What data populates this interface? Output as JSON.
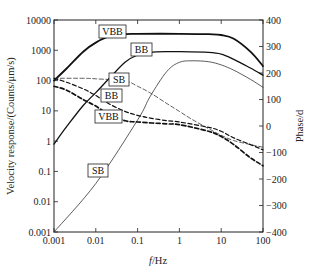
{
  "chart_data": {
    "type": "line",
    "title": "",
    "xlabel": "f/Hz",
    "ylabel": "Velocity response/(Counts/μm/s)",
    "y2label": "Phase/d",
    "xscale": "log",
    "yscale": "log",
    "xlim": [
      0.001,
      100
    ],
    "ylim": [
      0.001,
      10000
    ],
    "y2lim": [
      -400,
      400
    ],
    "grid": false,
    "legend": "inline boxed labels",
    "x_ticks": [
      "0.001",
      "0.01",
      "0.1",
      "1",
      "10",
      "100"
    ],
    "y_ticks": [
      "0.001",
      "0.01",
      "0.1",
      "1",
      "10",
      "100",
      "1000",
      "10000"
    ],
    "y2_ticks": [
      "-400",
      "-300",
      "-200",
      "-100",
      "0",
      "100",
      "200",
      "300",
      "400"
    ],
    "series": [
      {
        "name": "VBB",
        "kind": "amplitude",
        "axis": "left",
        "style": "solid-thick",
        "x": [
          0.001,
          0.002,
          0.005,
          0.01,
          0.02,
          0.05,
          0.1,
          1,
          5,
          10,
          20,
          50,
          100
        ],
        "y": [
          100,
          250,
          900,
          1800,
          2800,
          3400,
          3500,
          3500,
          3400,
          3200,
          2400,
          900,
          300
        ]
      },
      {
        "name": "BB",
        "kind": "amplitude",
        "axis": "left",
        "style": "solid",
        "x": [
          0.001,
          0.002,
          0.005,
          0.01,
          0.02,
          0.05,
          0.1,
          0.2,
          0.5,
          1,
          5,
          10,
          20,
          50,
          100
        ],
        "y": [
          0.8,
          3,
          15,
          40,
          110,
          400,
          700,
          850,
          900,
          900,
          850,
          750,
          500,
          260,
          150
        ]
      },
      {
        "name": "SB",
        "kind": "amplitude",
        "axis": "left",
        "style": "solid-thin",
        "x": [
          0.001,
          0.01,
          0.1,
          0.2,
          0.5,
          1,
          2,
          5,
          10,
          20,
          50,
          100
        ],
        "y": [
          0.001,
          0.04,
          5,
          30,
          200,
          400,
          450,
          420,
          330,
          220,
          110,
          60
        ]
      },
      {
        "name": "SB",
        "kind": "phase",
        "axis": "right",
        "style": "dashed-thin",
        "x": [
          0.001,
          0.005,
          0.01,
          0.05,
          0.1,
          0.2,
          0.5,
          1,
          2,
          5,
          10,
          20,
          50,
          100
        ],
        "y": [
          180,
          180,
          178,
          170,
          150,
          125,
          85,
          55,
          25,
          -10,
          -35,
          -55,
          -70,
          -80
        ]
      },
      {
        "name": "BB",
        "kind": "phase",
        "axis": "right",
        "style": "dashed",
        "x": [
          0.001,
          0.002,
          0.005,
          0.01,
          0.02,
          0.05,
          0.1,
          0.2,
          0.5,
          1,
          5,
          10,
          20,
          50,
          100
        ],
        "y": [
          180,
          165,
          140,
          115,
          85,
          55,
          40,
          30,
          20,
          15,
          -5,
          -20,
          -45,
          -70,
          -90
        ]
      },
      {
        "name": "VBB",
        "kind": "phase",
        "axis": "right",
        "style": "dashed-thick",
        "x": [
          0.001,
          0.002,
          0.005,
          0.01,
          0.02,
          0.05,
          0.1,
          0.5,
          1,
          5,
          10,
          20,
          50,
          100
        ],
        "y": [
          150,
          135,
          100,
          75,
          45,
          20,
          15,
          8,
          5,
          -20,
          -40,
          -70,
          -120,
          -150
        ]
      }
    ],
    "annotations": [
      {
        "text": "VBB",
        "target": "VBB amplitude",
        "x": 0.03,
        "y": 3500
      },
      {
        "text": "BB",
        "target": "BB amplitude",
        "x": 0.2,
        "y": 900
      },
      {
        "text": "SB",
        "target": "SB phase",
        "x": 0.03,
        "y": 110
      },
      {
        "text": "BB",
        "target": "BB phase",
        "x": 0.03,
        "y": 28
      },
      {
        "text": "VBB",
        "target": "VBB phase",
        "x": 0.03,
        "y": 8
      },
      {
        "text": "SB",
        "target": "SB amplitude",
        "x": 0.015,
        "y": 0.12
      }
    ]
  },
  "axes": {
    "x_title_italic": "f",
    "x_title_rest": "/Hz",
    "y_title": "Velocity response/(Counts/μm/s)",
    "y2_title": "Phase/d"
  },
  "labels": {
    "vbb_amp": "VBB",
    "bb_amp": "BB",
    "sb_phase": "SB",
    "bb_phase": "BB",
    "vbb_phase": "VBB",
    "sb_amp": "SB"
  },
  "ticks": {
    "x": [
      "0.001",
      "0.01",
      "0.1",
      "1",
      "10",
      "100"
    ],
    "y": [
      "0.001",
      "0.01",
      "0.1",
      "1",
      "10",
      "100",
      "1000",
      "10000"
    ],
    "y2": [
      "-400",
      "-300",
      "-200",
      "-100",
      "0",
      "100",
      "200",
      "300",
      "400"
    ]
  },
  "colors": {
    "line": "#1a1a1a",
    "thin_line": "#333333",
    "axis": "#222222"
  }
}
